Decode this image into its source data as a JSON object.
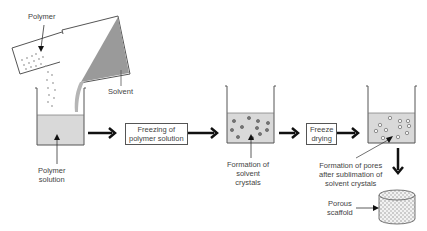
{
  "labels": {
    "polymer": "Polymer",
    "solvent": "Solvent",
    "polymer_solution_1": "Polymer",
    "polymer_solution_2": "solution",
    "step1_1": "Freezing of",
    "step1_2": "polymer solution",
    "crystals_1": "Formation of",
    "crystals_2": "solvent",
    "crystals_3": "crystals",
    "step2_1": "Freeze",
    "step2_2": "drying",
    "pores_1": "Formation of pores",
    "pores_2": "after sublimation of",
    "pores_3": "solvent crystals",
    "scaffold_1": "Porous",
    "scaffold_2": "scaffold"
  },
  "colors": {
    "liquid": "#d9d9d9",
    "solvent_fill": "#9a9a9a",
    "line": "#555555",
    "arrow": "#111111"
  }
}
